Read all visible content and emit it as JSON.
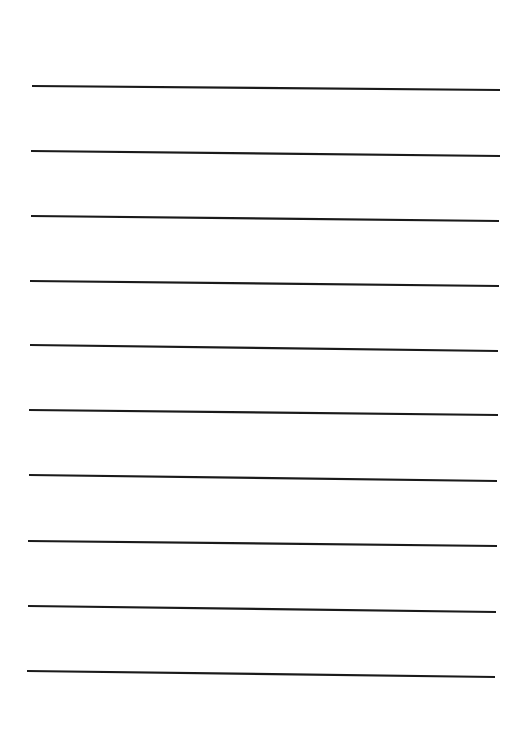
{
  "page": {
    "type": "lined-writing-sheet",
    "background_color": "#ffffff",
    "line_color": "#1a1a1a",
    "line_count": 10,
    "lines": [
      {
        "x1": 32,
        "y1": 86,
        "x2": 500,
        "y2": 90
      },
      {
        "x1": 31,
        "y1": 151,
        "x2": 500,
        "y2": 156
      },
      {
        "x1": 31,
        "y1": 216,
        "x2": 499,
        "y2": 221
      },
      {
        "x1": 30,
        "y1": 281,
        "x2": 499,
        "y2": 286
      },
      {
        "x1": 30,
        "y1": 345,
        "x2": 498,
        "y2": 351
      },
      {
        "x1": 29,
        "y1": 410,
        "x2": 498,
        "y2": 415
      },
      {
        "x1": 29,
        "y1": 475,
        "x2": 497,
        "y2": 481
      },
      {
        "x1": 28,
        "y1": 541,
        "x2": 497,
        "y2": 546
      },
      {
        "x1": 28,
        "y1": 606,
        "x2": 496,
        "y2": 612
      },
      {
        "x1": 27,
        "y1": 671,
        "x2": 495,
        "y2": 677
      }
    ]
  }
}
